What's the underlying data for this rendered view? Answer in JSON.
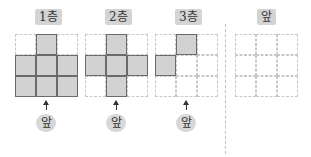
{
  "floors": [
    {
      "label": "1층",
      "filled": [
        [
          0,
          1,
          0
        ],
        [
          1,
          1,
          1
        ],
        [
          1,
          1,
          1
        ]
      ],
      "front_label": "앞"
    },
    {
      "label": "2층",
      "filled": [
        [
          0,
          1,
          0
        ],
        [
          1,
          1,
          1
        ],
        [
          0,
          1,
          0
        ]
      ],
      "front_label": "앞"
    },
    {
      "label": "3층",
      "filled": [
        [
          0,
          1,
          0
        ],
        [
          1,
          0,
          0
        ],
        [
          0,
          0,
          0
        ]
      ],
      "front_label": "앞"
    }
  ],
  "answer_view": {
    "label": "앞",
    "filled": [
      [
        0,
        0,
        0
      ],
      [
        0,
        0,
        0
      ],
      [
        0,
        0,
        0
      ]
    ]
  },
  "colors": {
    "filled": "#d2d2d2",
    "label_bg": "#d4d4d4",
    "dashed": "#c8c8c8"
  }
}
